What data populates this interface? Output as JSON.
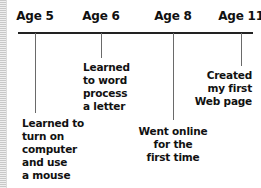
{
  "timeline": {
    "milestones": [
      {
        "age": "Age 5",
        "event": "Learned to\nturn on\ncomputer\nand use\na mouse"
      },
      {
        "age": "Age 6",
        "event": "Learned\nto word\nprocess\na letter"
      },
      {
        "age": "Age 8",
        "event": "Went online\nfor the\nfirst time"
      },
      {
        "age": "Age 11",
        "event": "Created\nmy first\nWeb page"
      }
    ]
  },
  "colors": {
    "text": "#111111",
    "axis": "#222222",
    "tick": "#6a6a6a",
    "background": "#ffffff"
  }
}
